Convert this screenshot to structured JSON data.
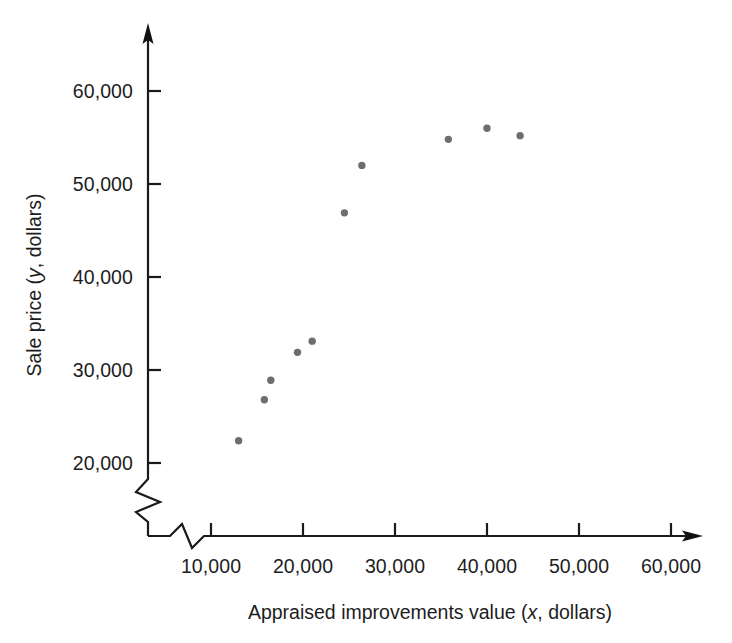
{
  "chart_data": {
    "type": "scatter",
    "title": "",
    "xlabel": "Appraised improvements value (x, dollars)",
    "xlabel_parts": {
      "before": "Appraised improvements value (",
      "italic": "x",
      "after": ", dollars)"
    },
    "ylabel": "Sale price (y, dollars)",
    "ylabel_parts": {
      "before": "Sale price (",
      "italic": "y",
      "after": ", dollars)"
    },
    "x_ticks": [
      10000,
      20000,
      30000,
      40000,
      50000,
      60000
    ],
    "x_tick_labels": [
      "10,000",
      "20,000",
      "30,000",
      "40,000",
      "50,000",
      "60,000"
    ],
    "y_ticks": [
      20000,
      30000,
      40000,
      50000,
      60000
    ],
    "y_tick_labels": [
      "20,000",
      "30,000",
      "40,000",
      "50,000",
      "60,000"
    ],
    "xlim": [
      7000,
      64000
    ],
    "ylim": [
      17500,
      64500
    ],
    "axis_break_x": true,
    "axis_break_y": true,
    "grid": false,
    "legend": false,
    "point_color": "#6e6e70",
    "axis_color": "#1a1a1a",
    "background_color": "#ffffff",
    "points": [
      {
        "x": 13000,
        "y": 22400
      },
      {
        "x": 15800,
        "y": 26800
      },
      {
        "x": 16500,
        "y": 28900
      },
      {
        "x": 19400,
        "y": 31900
      },
      {
        "x": 21000,
        "y": 33100
      },
      {
        "x": 24500,
        "y": 46900
      },
      {
        "x": 26400,
        "y": 52000
      },
      {
        "x": 35800,
        "y": 54800
      },
      {
        "x": 40000,
        "y": 56000
      },
      {
        "x": 43600,
        "y": 55200
      }
    ]
  }
}
